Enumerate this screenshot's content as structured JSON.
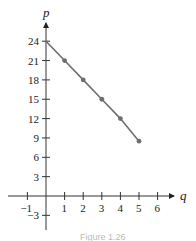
{
  "chart_data": {
    "type": "line",
    "title": "",
    "xlabel": "q",
    "ylabel": "p",
    "x": [
      0,
      1,
      2,
      3,
      4,
      5
    ],
    "series": [
      {
        "name": "p vs q",
        "values": [
          24,
          21,
          18,
          15,
          12,
          8.5
        ],
        "color": "#6e6e6e",
        "markers": true
      }
    ],
    "x_ticks": [
      -1,
      1,
      2,
      3,
      4,
      5,
      6
    ],
    "y_ticks": [
      -3,
      3,
      6,
      9,
      12,
      15,
      18,
      21,
      24
    ],
    "xlim": [
      -1.5,
      6.7
    ],
    "ylim": [
      -5,
      27
    ],
    "grid": false,
    "legend": "none"
  },
  "labels": {
    "x_axis": "q",
    "y_axis": "p",
    "x_ticks": [
      "−1",
      "1",
      "2",
      "3",
      "4",
      "5",
      "6"
    ],
    "y_ticks": [
      "−3",
      "3",
      "6",
      "9",
      "12",
      "15",
      "18",
      "21",
      "24"
    ],
    "caption": "Figure 1.26"
  }
}
